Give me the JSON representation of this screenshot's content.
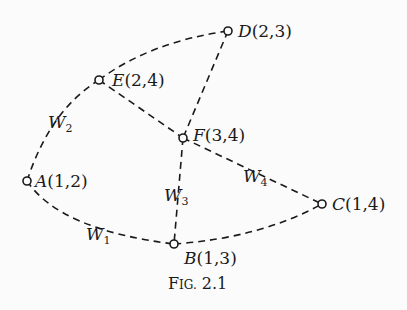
{
  "figure": {
    "caption": "Fig. 2.1",
    "caption_main": "F",
    "caption_small": "IG.",
    "caption_num": "2.1"
  },
  "nodes": [
    {
      "id": "A",
      "coords": "(1,2)",
      "x": 27,
      "y": 181
    },
    {
      "id": "B",
      "coords": "(1,3)",
      "x": 174,
      "y": 244
    },
    {
      "id": "C",
      "coords": "(1,4)",
      "x": 322,
      "y": 204
    },
    {
      "id": "D",
      "coords": "(2,3)",
      "x": 228,
      "y": 31
    },
    {
      "id": "E",
      "coords": "(2,4)",
      "x": 99,
      "y": 80
    },
    {
      "id": "F",
      "coords": "(3,4)",
      "x": 183,
      "y": 138
    }
  ],
  "edges": [
    {
      "from": "A",
      "to": "E",
      "label": "W",
      "sub": "2"
    },
    {
      "from": "E",
      "to": "D",
      "label": ""
    },
    {
      "from": "D",
      "to": "F",
      "label": ""
    },
    {
      "from": "E",
      "to": "F",
      "label": ""
    },
    {
      "from": "F",
      "to": "B",
      "label": "W",
      "sub": "3"
    },
    {
      "from": "F",
      "to": "C",
      "label": "W",
      "sub": "4"
    },
    {
      "from": "A",
      "to": "B",
      "label": "W",
      "sub": "1"
    },
    {
      "from": "B",
      "to": "C",
      "label": ""
    }
  ],
  "labels": {
    "A": {
      "letter": "A",
      "coords": "(1,2)"
    },
    "B": {
      "letter": "B",
      "coords": "(1,3)"
    },
    "C": {
      "letter": "C",
      "coords": "(1,4)"
    },
    "D": {
      "letter": "D",
      "coords": "(2,3)"
    },
    "E": {
      "letter": "E",
      "coords": "(2,4)"
    },
    "F": {
      "letter": "F",
      "coords": "(3,4)"
    },
    "W1": {
      "letter": "W",
      "sub": "1"
    },
    "W2": {
      "letter": "W",
      "sub": "2"
    },
    "W3": {
      "letter": "W",
      "sub": "3"
    },
    "W4": {
      "letter": "W",
      "sub": "4"
    }
  }
}
